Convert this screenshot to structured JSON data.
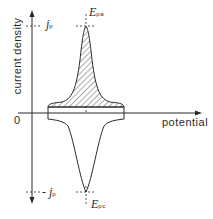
{
  "diagram": {
    "y_axis_label": "current density",
    "x_axis_label": "potential",
    "origin_label": "0",
    "jp_label": "j",
    "jp_sub": "p",
    "neg_jp_label": "- j",
    "neg_jp_sub": "p",
    "epa_label": "E",
    "epa_sub": "pa",
    "epc_label": "E",
    "epc_sub": "pc",
    "line_color": "#2a2a2a",
    "hatch_color": "#2a2a2a"
  }
}
